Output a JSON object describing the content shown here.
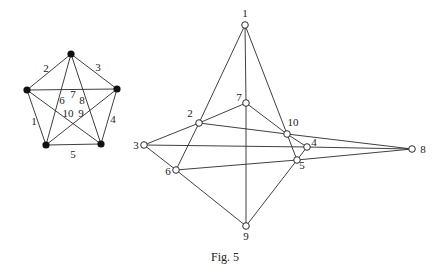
{
  "caption": "Fig. 5",
  "left_graph": {
    "name": "K5",
    "vertices": [
      {
        "id": "top",
        "x": 71,
        "y": 54
      },
      {
        "id": "left",
        "x": 27,
        "y": 90
      },
      {
        "id": "right",
        "x": 117,
        "y": 89
      },
      {
        "id": "bottom_left",
        "x": 46,
        "y": 145
      },
      {
        "id": "bottom_right",
        "x": 101,
        "y": 144
      }
    ],
    "edges": [
      {
        "from": 3,
        "to": 1,
        "label": "1"
      },
      {
        "from": 1,
        "to": 0,
        "label": "2"
      },
      {
        "from": 0,
        "to": 2,
        "label": "3"
      },
      {
        "from": 2,
        "to": 4,
        "label": "4"
      },
      {
        "from": 3,
        "to": 4,
        "label": "5"
      },
      {
        "from": 0,
        "to": 3,
        "label": "6"
      },
      {
        "from": 1,
        "to": 2,
        "label": "7"
      },
      {
        "from": 0,
        "to": 4,
        "label": "8"
      },
      {
        "from": 1,
        "to": 4,
        "label": "9"
      },
      {
        "from": 3,
        "to": 2,
        "label": "10"
      }
    ],
    "edge_labels": [
      {
        "text": "1",
        "x": 34,
        "y": 125
      },
      {
        "text": "2",
        "x": 46,
        "y": 72
      },
      {
        "text": "3",
        "x": 98,
        "y": 71
      },
      {
        "text": "4",
        "x": 113,
        "y": 123
      },
      {
        "text": "5",
        "x": 73,
        "y": 158
      },
      {
        "text": "6",
        "x": 62,
        "y": 104
      },
      {
        "text": "7",
        "x": 73,
        "y": 98
      },
      {
        "text": "8",
        "x": 82,
        "y": 104
      },
      {
        "text": "10",
        "x": 68,
        "y": 117
      },
      {
        "text": "9",
        "x": 81,
        "y": 117
      }
    ]
  },
  "right_graph": {
    "vertices": [
      {
        "label": "1",
        "x": 245,
        "y": 25,
        "lx": 245,
        "ly": 17
      },
      {
        "label": "2",
        "x": 199,
        "y": 123,
        "lx": 190,
        "ly": 117
      },
      {
        "label": "3",
        "x": 144,
        "y": 145,
        "lx": 136,
        "ly": 149
      },
      {
        "label": "4",
        "x": 307,
        "y": 147,
        "lx": 314,
        "ly": 146
      },
      {
        "label": "5",
        "x": 297,
        "y": 160,
        "lx": 302,
        "ly": 169
      },
      {
        "label": "6",
        "x": 176,
        "y": 170,
        "lx": 168,
        "ly": 175
      },
      {
        "label": "7",
        "x": 246,
        "y": 103,
        "lx": 239,
        "ly": 101
      },
      {
        "label": "8",
        "x": 412,
        "y": 149,
        "lx": 423,
        "ly": 153
      },
      {
        "label": "9",
        "x": 246,
        "y": 226,
        "lx": 246,
        "ly": 240
      },
      {
        "label": "10",
        "x": 287,
        "y": 134,
        "lx": 293,
        "ly": 126
      }
    ],
    "segments": [
      [
        1,
        2
      ],
      [
        2,
        6
      ],
      [
        1,
        7
      ],
      [
        7,
        9
      ],
      [
        1,
        10
      ],
      [
        10,
        5
      ],
      [
        3,
        2
      ],
      [
        2,
        7
      ],
      [
        7,
        10
      ],
      [
        10,
        4
      ],
      [
        2,
        10
      ],
      [
        10,
        8
      ],
      [
        3,
        4
      ],
      [
        4,
        8
      ],
      [
        6,
        5
      ],
      [
        5,
        8
      ],
      [
        3,
        6
      ],
      [
        6,
        9
      ],
      [
        9,
        5
      ],
      [
        4,
        5
      ]
    ]
  }
}
